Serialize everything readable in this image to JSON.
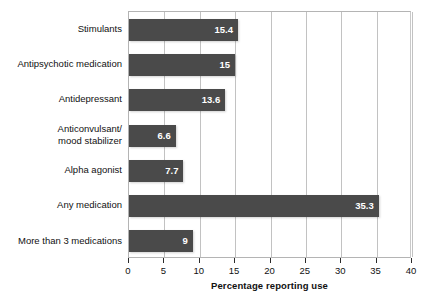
{
  "chart_data": {
    "type": "bar",
    "orientation": "horizontal",
    "title": "",
    "subtitle": "",
    "xlabel": "Percentage reporting use",
    "ylabel": "",
    "xlim": [
      0,
      40
    ],
    "xticks": [
      0,
      5,
      10,
      15,
      20,
      25,
      30,
      35,
      40
    ],
    "xtick_labels": [
      "0",
      "5",
      "10",
      "15",
      "20",
      "25",
      "30",
      "35",
      "40"
    ],
    "grid": "vertical",
    "legend": null,
    "categories": [
      "Stimulants",
      "Antipsychotic medication",
      "Antidepressant",
      "Anticonvulsant/\nmood stabilizer",
      "Alpha agonist",
      "Any medication",
      "More than 3 medications"
    ],
    "values": [
      15.4,
      15,
      13.6,
      6.6,
      7.7,
      35.3,
      9
    ],
    "value_labels": [
      "15.4",
      "15",
      "13.6",
      "6.6",
      "7.7",
      "35.3",
      "9"
    ],
    "bar_color": "#4a4a4a",
    "value_label_color": "#ffffff",
    "gridline_color": "#c2c2c2",
    "background_color": "#ffffff"
  }
}
